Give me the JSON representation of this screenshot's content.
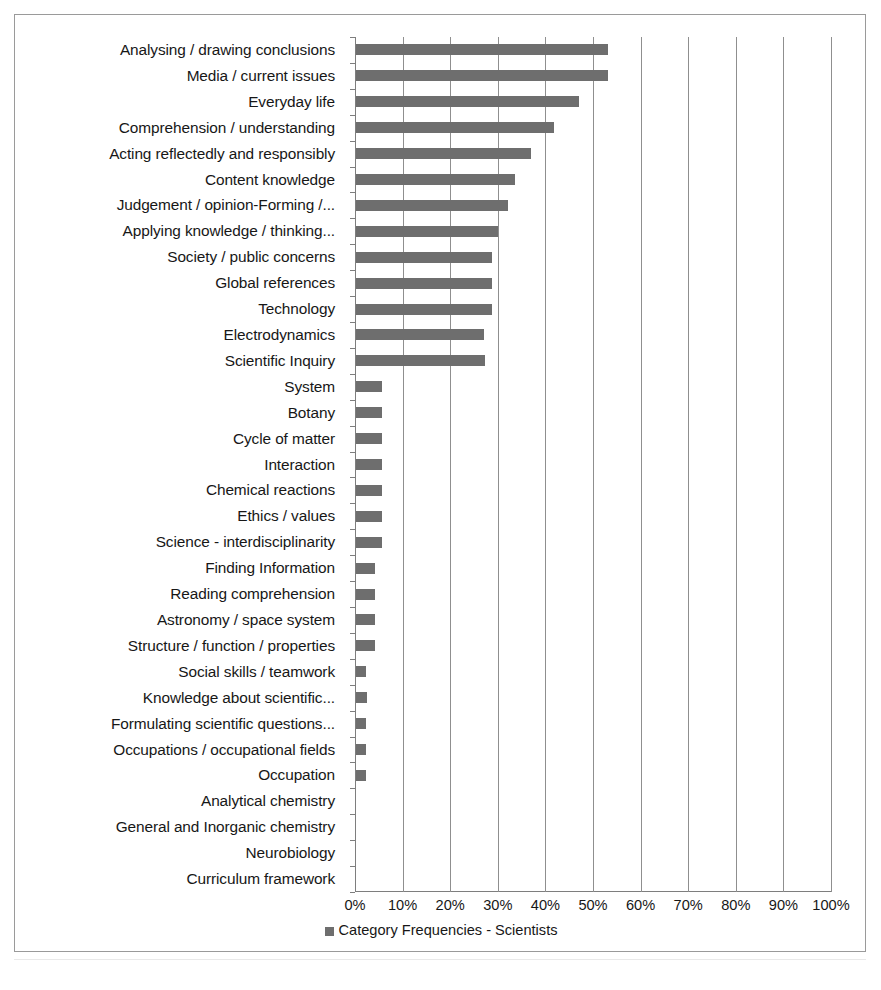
{
  "figure": {
    "legend_label": "Category Frequencies - Scientists",
    "legend_marker": "square-marker-icon",
    "caption": ""
  },
  "chart_data": {
    "type": "bar",
    "orientation": "horizontal",
    "title": "",
    "xlabel": "",
    "ylabel": "",
    "xlim": [
      0,
      100
    ],
    "x_unit": "%",
    "xticks": [
      "0%",
      "10%",
      "20%",
      "30%",
      "40%",
      "50%",
      "60%",
      "70%",
      "80%",
      "90%",
      "100%"
    ],
    "xtick_values": [
      0,
      10,
      20,
      30,
      40,
      50,
      60,
      70,
      80,
      90,
      100
    ],
    "grid": "vertical",
    "legend_position": "bottom-center",
    "bar_color": "#6e6e6e",
    "series": [
      {
        "name": "Category Frequencies - Scientists",
        "values": [
          52.9,
          52.9,
          46.9,
          41.7,
          36.8,
          33.3,
          31.9,
          29.8,
          28.6,
          28.6,
          28.6,
          26.8,
          27.0,
          5.5,
          5.5,
          5.5,
          5.5,
          5.5,
          5.5,
          5.5,
          3.9,
          3.9,
          3.9,
          4.0,
          2.1,
          2.3,
          2.0,
          2.0,
          2.0,
          0,
          0,
          0,
          0
        ]
      }
    ],
    "categories": [
      "Analysing / drawing conclusions",
      "Media / current issues",
      "Everyday life",
      "Comprehension / understanding",
      "Acting reflectedly and responsibly",
      "Content knowledge",
      "Judgement / opinion-Forming /...",
      "Applying knowledge / thinking...",
      "Society / public concerns",
      "Global references",
      "Technology",
      "Electrodynamics",
      "Scientific Inquiry",
      "System",
      "Botany",
      "Cycle of matter",
      "Interaction",
      "Chemical reactions",
      "Ethics / values",
      "Science - interdisciplinarity",
      "Finding Information",
      "Reading comprehension",
      "Astronomy / space system",
      "Structure / function / properties",
      "Social skills / teamwork",
      "Knowledge about scientific...",
      "Formulating scientific questions...",
      "Occupations / occupational fields",
      "Occupation",
      "Analytical chemistry",
      "General and Inorganic chemistry",
      "Neurobiology",
      "Curriculum framework"
    ]
  }
}
